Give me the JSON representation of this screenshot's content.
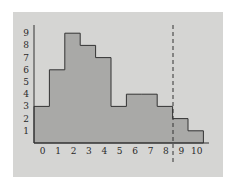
{
  "chart_data": {
    "type": "bar",
    "subtype": "histogram",
    "title": "",
    "xlabel": "",
    "ylabel": "",
    "categories": [
      "0",
      "1",
      "2",
      "3",
      "4",
      "5",
      "6",
      "7",
      "8",
      "9",
      "10"
    ],
    "values": [
      3,
      6,
      9,
      8,
      7,
      3,
      4,
      4,
      3,
      2,
      1
    ],
    "x_tick_labels": [
      "0",
      "1",
      "2",
      "3",
      "4",
      "5",
      "6",
      "7",
      "8",
      "9",
      "10"
    ],
    "y_tick_labels": [
      "1",
      "2",
      "3",
      "4",
      "5",
      "6",
      "7",
      "8",
      "9"
    ],
    "ylim": [
      0,
      9
    ],
    "grid": false,
    "legend": null,
    "annotations": [
      {
        "type": "vertical-dashed-line",
        "position": "between 8 and 9"
      }
    ],
    "colors": {
      "background": "#d5d5d3",
      "bar_fill": "#a9a9a7",
      "bar_stroke": "#333333",
      "axis": "#333333"
    }
  }
}
